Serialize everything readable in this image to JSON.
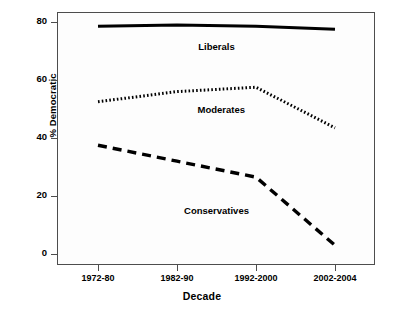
{
  "chart_data": {
    "type": "line",
    "title": "",
    "xlabel": "Decade",
    "ylabel": "% Democratic",
    "categories": [
      "1972-80",
      "1982-90",
      "1992-2000",
      "2002-2004"
    ],
    "ylim": [
      0,
      80
    ],
    "yticks": [
      0,
      20,
      40,
      60,
      80
    ],
    "grid": false,
    "legend_position": "inline-annotations",
    "series": [
      {
        "name": "Liberals",
        "style": "solid",
        "values": [
          78.5,
          79.0,
          78.5,
          77.5
        ]
      },
      {
        "name": "Moderates",
        "style": "dotted",
        "values": [
          52.5,
          56.0,
          57.5,
          43.5
        ]
      },
      {
        "name": "Conservatives",
        "style": "dashed",
        "values": [
          37.5,
          32.0,
          26.5,
          3.0
        ]
      }
    ],
    "annotations": [
      {
        "text": "Liberals",
        "x_category_fraction": 0.5,
        "value": 71.5
      },
      {
        "text": "Moderates",
        "x_category_fraction": 0.52,
        "value": 49.5
      },
      {
        "text": "Conservatives",
        "x_category_fraction": 0.5,
        "value": 15.0
      }
    ],
    "colors": {
      "line": "#000000",
      "axis": "#4d4d4d",
      "background": "#ffffff",
      "text": "#000000"
    }
  }
}
